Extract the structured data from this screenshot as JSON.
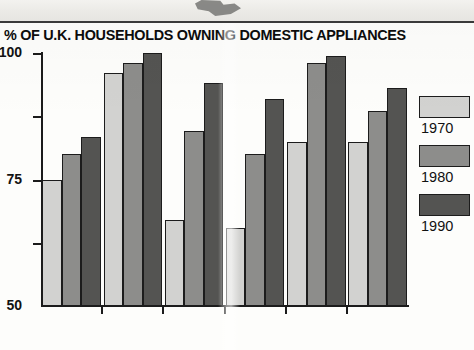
{
  "chart_data": {
    "type": "bar",
    "title": "% OF U.K. HOUSEHOLDS OWNING DOMESTIC APPLIANCES",
    "xlabel": "",
    "ylabel": "",
    "ylim": [
      0,
      100
    ],
    "yticks": [
      100,
      75,
      50,
      25
    ],
    "grid": false,
    "legend_position": "right",
    "categories": [
      "car",
      "T.V.",
      "phone",
      "central\nheating",
      "fridge",
      "washing\nmachine"
    ],
    "series": [
      {
        "name": "1970",
        "color": "#d2d2d0",
        "values": [
          50,
          92,
          34,
          31,
          65,
          65
        ]
      },
      {
        "name": "1980",
        "color": "#8d8d8b",
        "values": [
          60,
          96,
          69,
          60,
          96,
          77
        ]
      },
      {
        "name": "1990",
        "color": "#545452",
        "values": [
          67,
          100,
          88,
          82,
          99,
          86
        ]
      }
    ]
  },
  "legend": {
    "items": [
      {
        "label": "1970",
        "swatch": "legend-swatch-1970"
      },
      {
        "label": "1980",
        "swatch": "legend-swatch-1980"
      },
      {
        "label": "1990",
        "swatch": "legend-swatch-1990"
      }
    ]
  },
  "colors": {
    "series_1970": "#d2d2d0",
    "series_1980": "#8d8d8b",
    "series_1990": "#545452",
    "axis": "#1b1b1b",
    "text": "#111111",
    "background": "#fdfdfb"
  }
}
